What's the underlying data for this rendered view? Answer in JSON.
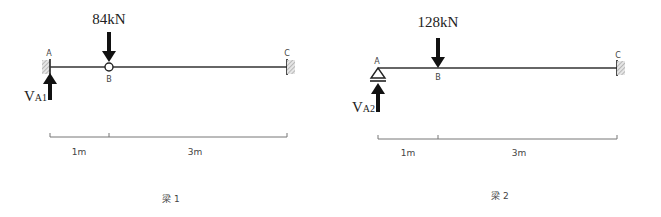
{
  "beams": [
    {
      "caption": "梁 1",
      "load": "84kN",
      "reaction": {
        "main": "V",
        "sub": "A1"
      },
      "points": {
        "a": "A",
        "b": "B",
        "c": "C"
      },
      "support_a": "fixed",
      "joint_b": "hinge",
      "support_c": "fixed",
      "dimensions": [
        "1m",
        "3m"
      ]
    },
    {
      "caption": "梁 2",
      "load": "128kN",
      "reaction": {
        "main": "V",
        "sub": "A2"
      },
      "points": {
        "a": "A",
        "b": "B",
        "c": "C"
      },
      "support_a": "pin",
      "joint_b": "rigid",
      "support_c": "fixed",
      "dimensions": [
        "1m",
        "3m"
      ]
    }
  ],
  "colors": {
    "line": "#333333",
    "arrow": "#111111",
    "hatch": "#999999",
    "dim": "#777777"
  }
}
